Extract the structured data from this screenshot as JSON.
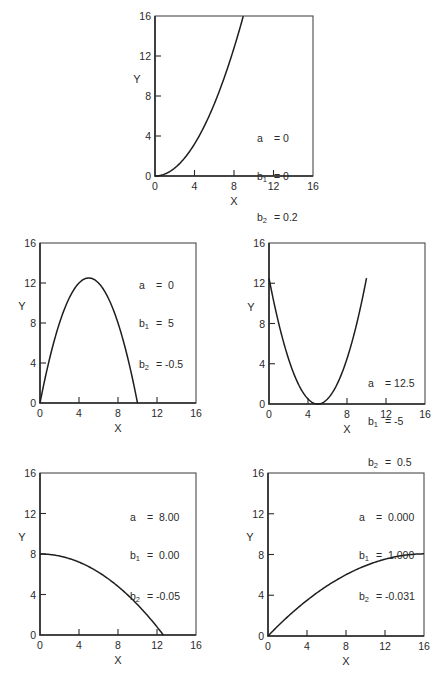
{
  "chart_data": [
    {
      "type": "line",
      "title": "",
      "xlabel": "X",
      "ylabel": "Y",
      "xlim": [
        0,
        16
      ],
      "ylim": [
        0,
        16
      ],
      "xticks": [
        0,
        4,
        8,
        12,
        16
      ],
      "yticks": [
        0,
        4,
        8,
        12,
        16
      ],
      "grid": false,
      "equation": "Y = a + b1*X + b2*X^2",
      "params": {
        "a": "0",
        "b1": "0",
        "b2": "0.2"
      },
      "coef": {
        "a": 0,
        "b1": 0,
        "b2": 0.2
      },
      "x_range": [
        0,
        8.94
      ],
      "series": [
        {
          "name": "curve",
          "x": [
            0,
            2,
            4,
            6,
            8,
            8.94
          ],
          "y": [
            0,
            0.8,
            3.2,
            7.2,
            12.8,
            16
          ]
        }
      ],
      "legend_position": "inside right"
    },
    {
      "type": "line",
      "xlabel": "X",
      "ylabel": "Y",
      "xlim": [
        0,
        16
      ],
      "ylim": [
        0,
        16
      ],
      "xticks": [
        0,
        4,
        8,
        12,
        16
      ],
      "yticks": [
        0,
        4,
        8,
        12,
        16
      ],
      "grid": false,
      "params": {
        "a": "0",
        "b1": "5",
        "b2": "-0.5"
      },
      "coef": {
        "a": 0,
        "b1": 5,
        "b2": -0.5
      },
      "x_range": [
        0,
        10
      ],
      "series": [
        {
          "name": "curve",
          "x": [
            0,
            2,
            4,
            5,
            6,
            8,
            10
          ],
          "y": [
            0,
            8,
            12,
            12.5,
            12,
            8,
            0
          ]
        }
      ],
      "legend_position": "upper right"
    },
    {
      "type": "line",
      "xlabel": "X",
      "ylabel": "Y",
      "xlim": [
        0,
        16
      ],
      "ylim": [
        0,
        16
      ],
      "xticks": [
        0,
        4,
        8,
        12,
        16
      ],
      "yticks": [
        0,
        4,
        8,
        12,
        16
      ],
      "grid": false,
      "params": {
        "a": "12.5",
        "b1": "-5",
        "b2": "0.5"
      },
      "coef": {
        "a": 12.5,
        "b1": -5,
        "b2": 0.5
      },
      "x_range": [
        0,
        10
      ],
      "series": [
        {
          "name": "curve",
          "x": [
            0,
            2,
            4,
            5,
            6,
            8,
            10
          ],
          "y": [
            12.5,
            4.5,
            0.5,
            0,
            0.5,
            4.5,
            12.5
          ]
        }
      ],
      "legend_position": "lower right"
    },
    {
      "type": "line",
      "xlabel": "X",
      "ylabel": "Y",
      "xlim": [
        0,
        16
      ],
      "ylim": [
        0,
        16
      ],
      "xticks": [
        0,
        4,
        8,
        12,
        16
      ],
      "yticks": [
        0,
        4,
        8,
        12,
        16
      ],
      "grid": false,
      "params": {
        "a": "8.00",
        "b1": "0.00",
        "b2": "-0.05"
      },
      "coef": {
        "a": 8,
        "b1": 0,
        "b2": -0.05
      },
      "x_range": [
        0,
        12.65
      ],
      "series": [
        {
          "name": "curve",
          "x": [
            0,
            4,
            8,
            12,
            12.65
          ],
          "y": [
            8,
            7.2,
            4.8,
            0.8,
            0
          ]
        }
      ],
      "legend_position": "upper right"
    },
    {
      "type": "line",
      "xlabel": "X",
      "ylabel": "Y",
      "xlim": [
        0,
        16
      ],
      "ylim": [
        0,
        16
      ],
      "xticks": [
        0,
        4,
        8,
        12,
        16
      ],
      "yticks": [
        0,
        4,
        8,
        12,
        16
      ],
      "grid": false,
      "params": {
        "a": "0.000",
        "b1": "1.000",
        "b2": "-0.031"
      },
      "coef": {
        "a": 0,
        "b1": 1,
        "b2": -0.031
      },
      "x_range": [
        0,
        16
      ],
      "series": [
        {
          "name": "curve",
          "x": [
            0,
            4,
            8,
            12,
            16
          ],
          "y": [
            0,
            3.5,
            6.02,
            7.54,
            8.06
          ]
        }
      ],
      "legend_position": "upper right"
    }
  ],
  "panels": [
    {
      "legend": {
        "a_name": "a",
        "b1_name": "b",
        "b1_sub": "1",
        "b2_name": "b",
        "b2_sub": "2",
        "a_val": "= 0",
        "b1_val": "= 0",
        "b2_val": "= 0.2"
      }
    },
    {
      "legend": {
        "a_name": "a",
        "b1_name": "b",
        "b1_sub": "1",
        "b2_name": "b",
        "b2_sub": "2",
        "a_val": "=  0",
        "b1_val": "=  5",
        "b2_val": "= -0.5"
      }
    },
    {
      "legend": {
        "a_name": "a",
        "b1_name": "b",
        "b1_sub": "1",
        "b2_name": "b",
        "b2_sub": "2",
        "a_val": "= 12.5",
        "b1_val": "= -5",
        "b2_val": "=  0.5"
      }
    },
    {
      "legend": {
        "a_name": "a",
        "b1_name": "b",
        "b1_sub": "1",
        "b2_name": "b",
        "b2_sub": "2",
        "a_val": "=  8.00",
        "b1_val": "=  0.00",
        "b2_val": "= -0.05"
      }
    },
    {
      "legend": {
        "a_name": "a",
        "b1_name": "b",
        "b1_sub": "1",
        "b2_name": "b",
        "b2_sub": "2",
        "a_val": "=  0.000",
        "b1_val": "=  1.000",
        "b2_val": "= -0.031"
      }
    }
  ],
  "axis": {
    "x_label": "X",
    "y_label": "Y",
    "tick_labels": [
      "0",
      "4",
      "8",
      "12",
      "16"
    ]
  }
}
